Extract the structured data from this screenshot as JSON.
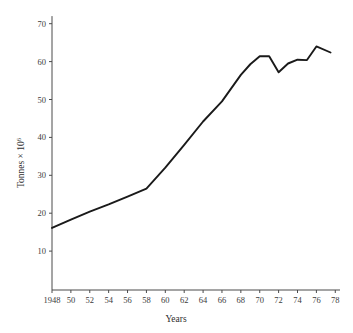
{
  "chart_data": {
    "type": "line",
    "title": "",
    "xlabel": "Years",
    "ylabel": "Tonnes × 10",
    "ylabel_exponent": "6",
    "xlim": [
      1948,
      1978.5
    ],
    "ylim": [
      0,
      72
    ],
    "grid": false,
    "legend": null,
    "y_ticks": [
      10,
      20,
      30,
      40,
      50,
      60,
      70
    ],
    "y_tick_labels": [
      "10",
      "20",
      "30",
      "40",
      "50",
      "60",
      "70"
    ],
    "x_ticks": [
      1948,
      1950,
      1952,
      1954,
      1956,
      1958,
      1960,
      1962,
      1964,
      1966,
      1968,
      1970,
      1972,
      1974,
      1976,
      1978
    ],
    "x_tick_labels": [
      "1948",
      "50",
      "52",
      "54",
      "56",
      "58",
      "60",
      "62",
      "64",
      "66",
      "68",
      "70",
      "72",
      "74",
      "76",
      "78"
    ],
    "series": [
      {
        "name": "Tonnes",
        "x": [
          1948,
          1950,
          1952,
          1954,
          1956,
          1958,
          1960,
          1962,
          1964,
          1966,
          1968,
          1969,
          1970,
          1971,
          1972,
          1973,
          1974,
          1975,
          1976,
          1977.5
        ],
        "values": [
          16.1,
          18.3,
          20.4,
          22.3,
          24.4,
          26.5,
          32.0,
          38.0,
          44.2,
          49.5,
          56.5,
          59.3,
          61.4,
          61.4,
          57.2,
          59.5,
          60.5,
          60.4,
          64.0,
          62.4
        ]
      }
    ]
  },
  "axis": {
    "y_title_prefix": "Tonnes × 10",
    "y_title_exponent": "6",
    "x_title": "Years"
  }
}
